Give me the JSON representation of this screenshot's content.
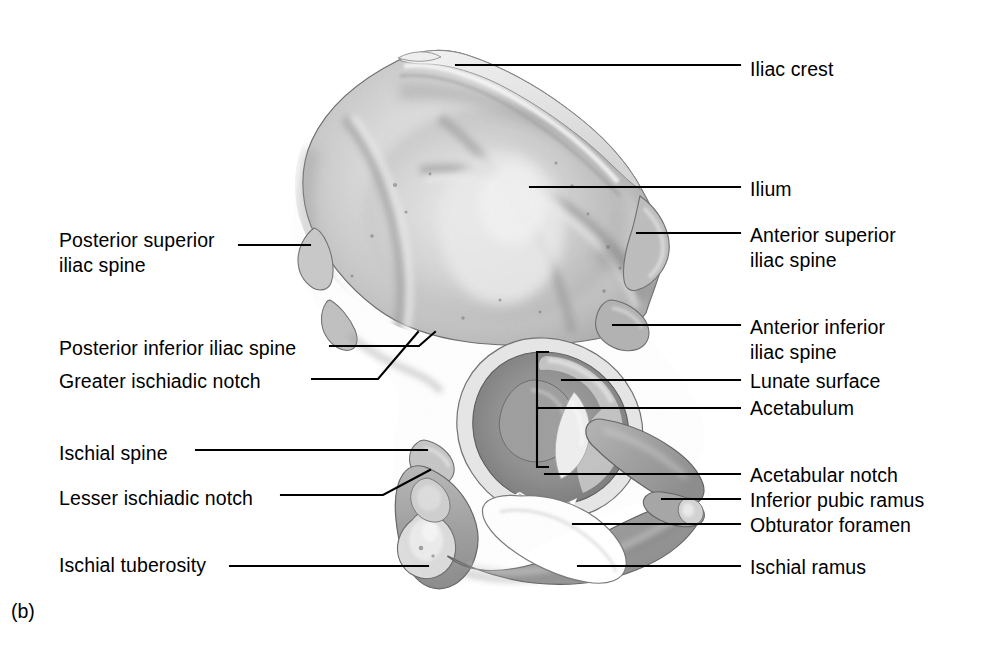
{
  "figure": {
    "panel_letter": "(b)",
    "background_color": "#ffffff",
    "line_color": "#000000",
    "text_color": "#000000",
    "bone_tones": {
      "outline": "#4a4a4a",
      "light": "#e9e9e9",
      "mid": "#c6c6c6",
      "mid_dark": "#a8a8a8",
      "dark": "#8a8a8a",
      "darkest": "#6e6e6e",
      "highlight": "#f2f2f2",
      "foramen": "#ffffff"
    }
  },
  "labels_right": [
    {
      "id": "iliac-crest",
      "text": "Iliac crest",
      "text2": "",
      "x": 750,
      "y": 57
    },
    {
      "id": "ilium",
      "text": "Ilium",
      "text2": "",
      "x": 750,
      "y": 177
    },
    {
      "id": "anterior-superior-iliac-spine",
      "text": "Anterior superior",
      "text2": "iliac spine",
      "x": 750,
      "y": 223
    },
    {
      "id": "anterior-inferior-iliac-spine",
      "text": "Anterior inferior",
      "text2": "iliac spine",
      "x": 750,
      "y": 315
    },
    {
      "id": "lunate-surface",
      "text": "Lunate surface",
      "text2": "",
      "x": 750,
      "y": 369
    },
    {
      "id": "acetabulum",
      "text": "Acetabulum",
      "text2": "",
      "x": 750,
      "y": 396
    },
    {
      "id": "acetabular-notch",
      "text": "Acetabular notch",
      "text2": "",
      "x": 750,
      "y": 463
    },
    {
      "id": "inferior-pubic-ramus",
      "text": "Inferior pubic ramus",
      "text2": "",
      "x": 750,
      "y": 488
    },
    {
      "id": "obturator-foramen",
      "text": "Obturator foramen",
      "text2": "",
      "x": 750,
      "y": 513
    },
    {
      "id": "ischial-ramus",
      "text": "Ischial ramus",
      "text2": "",
      "x": 750,
      "y": 555
    }
  ],
  "labels_left": [
    {
      "id": "posterior-superior-iliac-spine",
      "text": "Posterior superior",
      "text2": "iliac spine",
      "x": 59,
      "y": 228
    },
    {
      "id": "posterior-inferior-iliac-spine",
      "text": "Posterior inferior iliac spine",
      "text2": "",
      "x": 59,
      "y": 336
    },
    {
      "id": "greater-ischiadic-notch",
      "text": "Greater ischiadic notch",
      "text2": "",
      "x": 59,
      "y": 369
    },
    {
      "id": "ischial-spine",
      "text": "Ischial spine",
      "text2": "",
      "x": 59,
      "y": 441
    },
    {
      "id": "lesser-ischiadic-notch",
      "text": "Lesser ischiadic notch",
      "text2": "",
      "x": 59,
      "y": 486
    },
    {
      "id": "ischial-tuberosity",
      "text": "Ischial tuberosity",
      "text2": "",
      "x": 59,
      "y": 553
    }
  ],
  "leaders": [
    {
      "id": "leader-iliac-crest",
      "points": "456,65 740,65"
    },
    {
      "id": "leader-ilium",
      "points": "530,187 740,187"
    },
    {
      "id": "leader-anterior-superior-iliac-spine",
      "points": "637,233 740,233"
    },
    {
      "id": "leader-anterior-inferior-iliac-spine",
      "points": "613,325 740,325"
    },
    {
      "id": "leader-lunate-surface",
      "points": "562,380 740,380"
    },
    {
      "id": "leader-acetabulum",
      "points": "537,408 740,408"
    },
    {
      "id": "leader-acetabular-notch",
      "points": "545,474 740,474"
    },
    {
      "id": "leader-inferior-pubic-ramus",
      "points": "662,499 740,499"
    },
    {
      "id": "leader-obturator-foramen",
      "points": "573,524 740,524"
    },
    {
      "id": "leader-ischial-ramus",
      "points": "578,566 740,566"
    },
    {
      "id": "leader-posterior-superior-iliac-spine",
      "points": "239,245 310,245"
    },
    {
      "id": "leader-posterior-inferior-iliac-spine",
      "points": "330,346 419,346 435,332"
    },
    {
      "id": "leader-greater-ischiadic-notch",
      "points": "312,379 378,379 418,332"
    },
    {
      "id": "leader-ischial-spine",
      "points": "196,450 427,450"
    },
    {
      "id": "leader-lesser-ischiadic-notch",
      "points": "281,495 383,495 430,470"
    },
    {
      "id": "leader-ischial-tuberosity",
      "points": "230,566 428,566"
    }
  ],
  "acetabulum_bracket": {
    "id": "acetabulum-bracket",
    "points": "548,352 537,352 537,467 548,467"
  }
}
